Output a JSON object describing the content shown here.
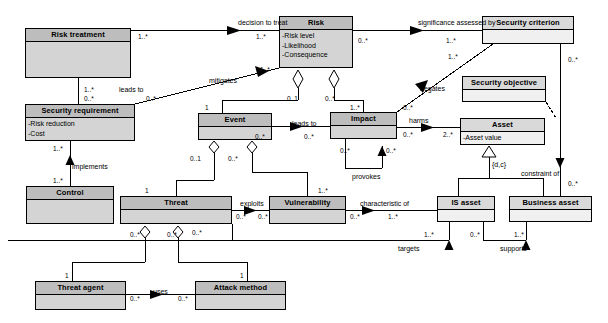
{
  "diagram": {
    "type": "uml-class-diagram",
    "canvas": {
      "width": 608,
      "height": 323
    },
    "colors": {
      "box_fill_gray": "#d4d4d4",
      "box_fill_light": "#f0f0f0",
      "header_fill_gray": "#bdbdbd",
      "header_fill_light": "#d9d9d9",
      "line": "#000000",
      "background": "#ffffff"
    }
  },
  "classes": [
    {
      "id": "risk_treatment",
      "name": "Risk treatment",
      "attributes": [],
      "fill": "gray",
      "x": 25,
      "y": 28,
      "w": 106,
      "h": 50
    },
    {
      "id": "security_requirement",
      "name": "Security requirement",
      "attributes": [
        "-Risk reduction",
        "-Cost"
      ],
      "fill": "gray",
      "x": 25,
      "y": 104,
      "w": 110,
      "h": 37
    },
    {
      "id": "control",
      "name": "Control",
      "attributes": [],
      "fill": "gray",
      "x": 26,
      "y": 186,
      "w": 88,
      "h": 38
    },
    {
      "id": "threat_agent",
      "name": "Threat agent",
      "attributes": [],
      "fill": "gray",
      "x": 35,
      "y": 281,
      "w": 91,
      "h": 29
    },
    {
      "id": "attack_method",
      "name": "Attack method",
      "attributes": [],
      "fill": "gray",
      "x": 195,
      "y": 281,
      "w": 91,
      "h": 29
    },
    {
      "id": "threat",
      "name": "Threat",
      "attributes": [],
      "fill": "gray",
      "x": 120,
      "y": 196,
      "w": 112,
      "h": 28
    },
    {
      "id": "vulnerability",
      "name": "Vulnerability",
      "attributes": [],
      "fill": "gray",
      "x": 269,
      "y": 196,
      "w": 77,
      "h": 28
    },
    {
      "id": "event",
      "name": "Event",
      "attributes": [],
      "fill": "gray",
      "x": 198,
      "y": 113,
      "w": 74,
      "h": 27
    },
    {
      "id": "impact",
      "name": "Impact",
      "attributes": [],
      "fill": "gray",
      "x": 330,
      "y": 112,
      "w": 67,
      "h": 27
    },
    {
      "id": "risk",
      "name": "Risk",
      "attributes": [
        "-Risk level",
        "-Likelihood",
        "-Consequence"
      ],
      "fill": "gray",
      "x": 279,
      "y": 16,
      "w": 74,
      "h": 52
    },
    {
      "id": "security_criterion",
      "name": "Security criterion",
      "attributes": [],
      "fill": "light",
      "x": 482,
      "y": 16,
      "w": 92,
      "h": 28
    },
    {
      "id": "security_objective",
      "name": "Security objective",
      "attributes": [],
      "fill": "light",
      "x": 462,
      "y": 76,
      "w": 84,
      "h": 26
    },
    {
      "id": "asset",
      "name": "Asset",
      "attributes": [
        "-Asset value"
      ],
      "fill": "light",
      "x": 460,
      "y": 118,
      "w": 85,
      "h": 27
    },
    {
      "id": "is_asset",
      "name": "IS asset",
      "attributes": [],
      "fill": "light",
      "x": 437,
      "y": 196,
      "w": 58,
      "h": 26
    },
    {
      "id": "business_asset",
      "name": "Business asset",
      "attributes": [],
      "fill": "light",
      "x": 509,
      "y": 196,
      "w": 83,
      "h": 26
    }
  ],
  "association_labels": [
    {
      "id": "decision_to_treat",
      "text": "decision to treat",
      "x": 238,
      "y": 19
    },
    {
      "id": "significance",
      "text": "significance assessed by",
      "x": 418,
      "y": 19
    },
    {
      "id": "mitigates",
      "text": "mitigates",
      "x": 209,
      "y": 77
    },
    {
      "id": "leads_to_left",
      "text": "leads to",
      "x": 119,
      "y": 86
    },
    {
      "id": "negates",
      "text": "negates",
      "x": 420,
      "y": 85
    },
    {
      "id": "leads_to_mid",
      "text": "leads to",
      "x": 292,
      "y": 120
    },
    {
      "id": "harms",
      "text": "harms",
      "x": 409,
      "y": 117
    },
    {
      "id": "constraint_of",
      "text": "constraint of",
      "x": 521,
      "y": 170
    },
    {
      "id": "provokes",
      "text": "provokes",
      "x": 352,
      "y": 173
    },
    {
      "id": "implements",
      "text": "implements",
      "x": 72,
      "y": 163
    },
    {
      "id": "exploits",
      "text": "exploits",
      "x": 240,
      "y": 200
    },
    {
      "id": "characteristic_of",
      "text": "characteristic of",
      "x": 360,
      "y": 200
    },
    {
      "id": "targets",
      "text": "targets",
      "x": 398,
      "y": 245
    },
    {
      "id": "supports",
      "text": "supports",
      "x": 500,
      "y": 245
    },
    {
      "id": "uses",
      "text": "uses",
      "x": 153,
      "y": 288
    },
    {
      "id": "dc_constraint",
      "text": "{d,c}",
      "x": 492,
      "y": 161
    }
  ],
  "multiplicities": [
    {
      "id": "m1",
      "text": "1..*",
      "x": 138,
      "y": 33
    },
    {
      "id": "m2",
      "text": "1..*",
      "x": 256,
      "y": 33
    },
    {
      "id": "m3",
      "text": "1..*",
      "x": 84,
      "y": 86
    },
    {
      "id": "m4",
      "text": "0..*",
      "x": 84,
      "y": 95
    },
    {
      "id": "m5",
      "text": "0..*",
      "x": 146,
      "y": 95
    },
    {
      "id": "m6",
      "text": "1..*",
      "x": 260,
      "y": 66
    },
    {
      "id": "m7",
      "text": "0..*",
      "x": 358,
      "y": 37
    },
    {
      "id": "m8",
      "text": "1..*",
      "x": 446,
      "y": 37
    },
    {
      "id": "m9",
      "text": "1..*",
      "x": 448,
      "y": 53
    },
    {
      "id": "m10",
      "text": "0..1",
      "x": 287,
      "y": 95
    },
    {
      "id": "m11",
      "text": "0..*",
      "x": 325,
      "y": 95
    },
    {
      "id": "m12",
      "text": "1",
      "x": 205,
      "y": 104
    },
    {
      "id": "m13",
      "text": "1..*",
      "x": 350,
      "y": 104
    },
    {
      "id": "m14",
      "text": "0..*",
      "x": 403,
      "y": 104
    },
    {
      "id": "m15",
      "text": "0..*",
      "x": 255,
      "y": 133
    },
    {
      "id": "m16",
      "text": "0..*",
      "x": 304,
      "y": 133
    },
    {
      "id": "m17",
      "text": "0..*",
      "x": 403,
      "y": 131
    },
    {
      "id": "m18",
      "text": "2..*",
      "x": 443,
      "y": 131
    },
    {
      "id": "m19",
      "text": "0..1",
      "x": 190,
      "y": 155
    },
    {
      "id": "m20",
      "text": "0..*",
      "x": 228,
      "y": 155
    },
    {
      "id": "m21",
      "text": "0..*",
      "x": 340,
      "y": 147
    },
    {
      "id": "m22",
      "text": "0..*",
      "x": 386,
      "y": 147
    },
    {
      "id": "m23",
      "text": "1..*",
      "x": 53,
      "y": 145
    },
    {
      "id": "m24",
      "text": "1..*",
      "x": 53,
      "y": 177
    },
    {
      "id": "m25",
      "text": "0..*",
      "x": 568,
      "y": 56
    },
    {
      "id": "m26",
      "text": "0..*",
      "x": 568,
      "y": 180
    },
    {
      "id": "m27",
      "text": "1",
      "x": 145,
      "y": 187
    },
    {
      "id": "m28",
      "text": "1..*",
      "x": 318,
      "y": 187
    },
    {
      "id": "m29",
      "text": "0..*",
      "x": 236,
      "y": 213
    },
    {
      "id": "m30",
      "text": "0..*",
      "x": 258,
      "y": 213
    },
    {
      "id": "m31",
      "text": "0..*",
      "x": 350,
      "y": 213
    },
    {
      "id": "m32",
      "text": "1..*",
      "x": 388,
      "y": 213
    },
    {
      "id": "m33",
      "text": "0..*",
      "x": 130,
      "y": 231
    },
    {
      "id": "m34",
      "text": "0..*",
      "x": 167,
      "y": 231
    },
    {
      "id": "m35",
      "text": "0..*",
      "x": 192,
      "y": 229
    },
    {
      "id": "m36",
      "text": "1",
      "x": 65,
      "y": 272
    },
    {
      "id": "m37",
      "text": "1",
      "x": 240,
      "y": 272
    },
    {
      "id": "m38",
      "text": "0..*",
      "x": 130,
      "y": 295
    },
    {
      "id": "m39",
      "text": "0..*",
      "x": 178,
      "y": 295
    },
    {
      "id": "m40",
      "text": "1..*",
      "x": 424,
      "y": 231
    },
    {
      "id": "m41",
      "text": "0..*",
      "x": 470,
      "y": 231
    },
    {
      "id": "m42",
      "text": "1..*",
      "x": 514,
      "y": 231
    }
  ]
}
